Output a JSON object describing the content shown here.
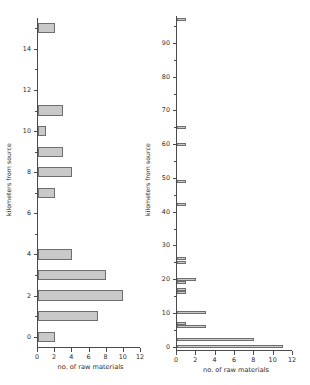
{
  "figure": {
    "background": "#ffffff",
    "bar_fill": "#c9c9c9",
    "bar_stroke": "#6e6e6e",
    "axis_color": "#4a4a4a"
  },
  "chart_data": [
    {
      "id": "left",
      "type": "bar",
      "orientation": "horizontal",
      "title": "",
      "xlabel": "no. of raw materials",
      "ylabel": "kilometers from source",
      "xlim": [
        0,
        12
      ],
      "ylim": [
        -0.5,
        15.5
      ],
      "xticks": [
        0,
        2,
        4,
        6,
        8,
        10,
        12
      ],
      "xticklabels": [
        "0",
        "2",
        "4",
        "6",
        "8",
        "10",
        "12"
      ],
      "yticks": [
        0,
        2,
        4,
        6,
        8,
        10,
        12,
        14
      ],
      "yticklabels": [
        "0",
        "2",
        "4",
        "6",
        "8",
        "10",
        "12",
        "14"
      ],
      "yminorticks": [
        1,
        3,
        5,
        7,
        9,
        11,
        13,
        15
      ],
      "grid": false,
      "legend": null,
      "categories": [
        0,
        1,
        2,
        3,
        4,
        5,
        6,
        7,
        8,
        9,
        10,
        11,
        12,
        13,
        14,
        15
      ],
      "values": [
        2,
        7,
        10,
        8,
        4,
        0,
        0,
        2,
        4,
        3,
        1,
        3,
        0,
        0,
        0,
        2
      ]
    },
    {
      "id": "right",
      "type": "bar",
      "orientation": "horizontal",
      "title": "",
      "xlabel": "no. of raw materials",
      "ylabel": "kilometers from source",
      "xlim": [
        0,
        12
      ],
      "ylim": [
        -1,
        98
      ],
      "xticks": [
        0,
        2,
        4,
        6,
        8,
        10,
        12
      ],
      "xticklabels": [
        "0",
        "2",
        "4",
        "6",
        "8",
        "10",
        "12"
      ],
      "yticks": [
        0,
        10,
        20,
        30,
        40,
        50,
        60,
        70,
        80,
        90
      ],
      "yticklabels": [
        "0",
        "10",
        "20",
        "30",
        "40",
        "50",
        "60",
        "70",
        "80",
        "90"
      ],
      "yminorticks": [
        5,
        15,
        25,
        35,
        45,
        55,
        65,
        75,
        85,
        95
      ],
      "grid": false,
      "legend": null,
      "points": [
        {
          "y": 0,
          "value": 11
        },
        {
          "y": 2,
          "value": 8
        },
        {
          "y": 6,
          "value": 3
        },
        {
          "y": 7,
          "value": 1
        },
        {
          "y": 10,
          "value": 3
        },
        {
          "y": 16,
          "value": 1
        },
        {
          "y": 17,
          "value": 1
        },
        {
          "y": 19,
          "value": 1
        },
        {
          "y": 20,
          "value": 2
        },
        {
          "y": 25,
          "value": 1
        },
        {
          "y": 26,
          "value": 1
        },
        {
          "y": 42,
          "value": 1
        },
        {
          "y": 49,
          "value": 1
        },
        {
          "y": 60,
          "value": 1
        },
        {
          "y": 65,
          "value": 1
        },
        {
          "y": 97,
          "value": 1
        }
      ]
    }
  ]
}
